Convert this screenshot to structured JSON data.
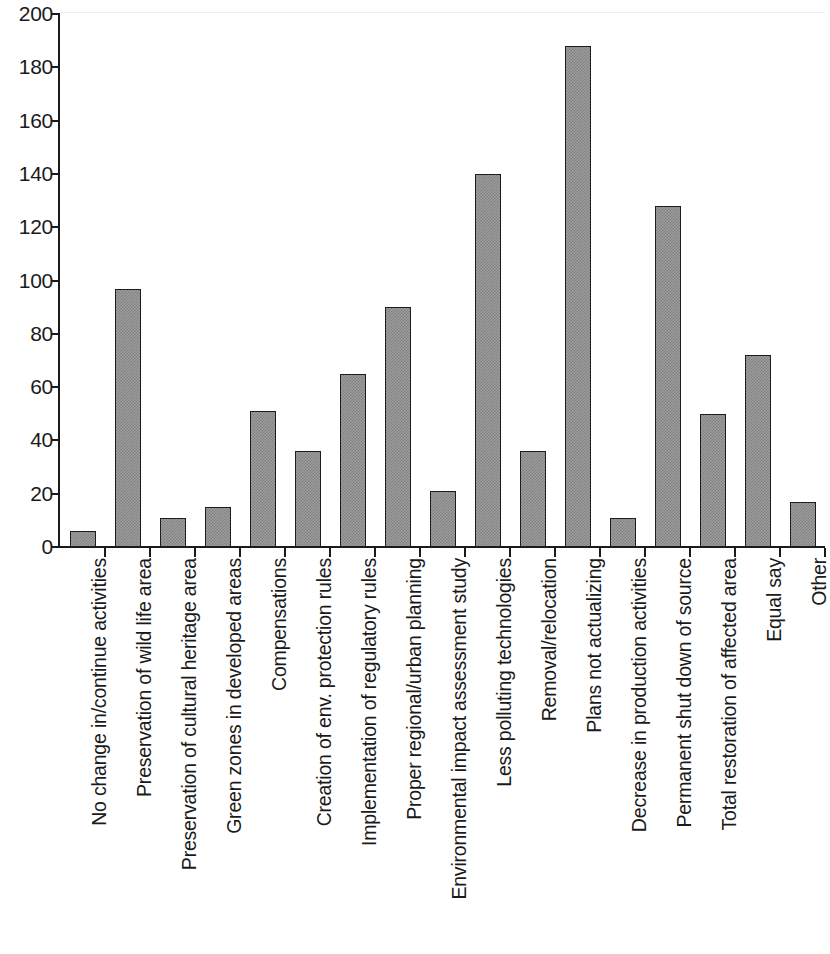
{
  "chart_data": {
    "type": "bar",
    "title": "",
    "subtitle": "",
    "xlabel": "",
    "ylabel": "",
    "ylim": [
      0,
      200
    ],
    "ytick_interval": 20,
    "yticks": [
      0,
      20,
      40,
      60,
      80,
      100,
      120,
      140,
      160,
      180,
      200
    ],
    "grid": false,
    "legend": false,
    "legend_position": "none",
    "orientation": "vertical",
    "xtick_label_rotation": -90,
    "bar_fill_color": "#9d9d9d",
    "bar_edge_color": "#1d1d1d",
    "axis_color": "#1a1a1a",
    "background_color": "#ffffff",
    "categories": [
      "No change in/continue activities",
      "Preservation of wild life area",
      "Preservation of cultural heritage area",
      "Green zones in developed areas",
      "Compensations",
      "Creation of env. protection rules",
      "Implementation of regulatory rules",
      "Proper regional/urban planning",
      "Environmental impact assessment study",
      "Less polluting technologies",
      "Removal/relocation",
      "Plans not actualizing",
      "Decrease in production activities",
      "Permanent shut down of source",
      "Total restoration of affected area",
      "Equal say",
      "Other"
    ],
    "values": [
      6,
      97,
      11,
      15,
      51,
      36,
      65,
      90,
      21,
      140,
      36,
      188,
      11,
      128,
      50,
      72,
      17
    ]
  }
}
